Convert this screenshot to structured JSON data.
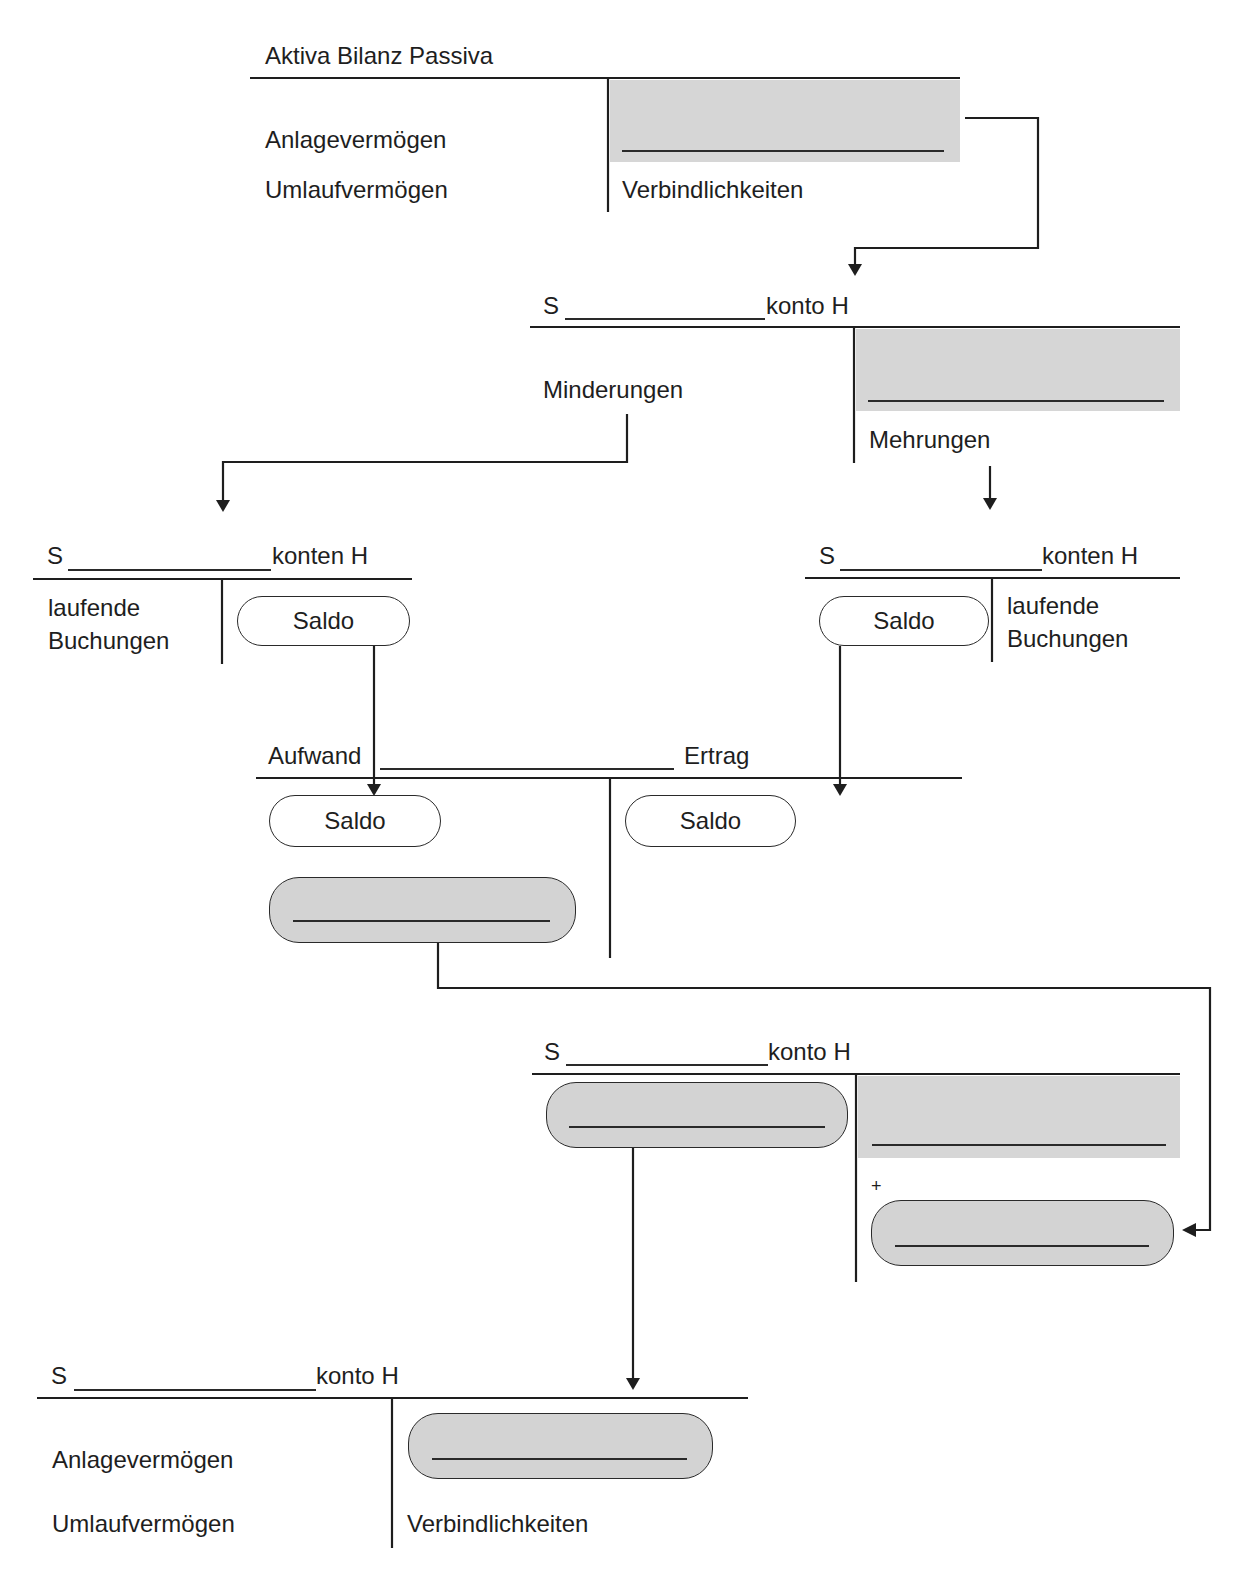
{
  "bilanz_top": {
    "title": "Aktiva Bilanz Passiva",
    "left_items": [
      "Anlagevermögen",
      "Umlaufvermögen"
    ],
    "right_items": [
      "Verbindlichkeiten"
    ],
    "blank_field": ""
  },
  "konto_1": {
    "s_label": "S",
    "suffix": "konto H",
    "blank_field": "",
    "left_label": "Minderungen",
    "right_label": "Mehrungen"
  },
  "konto_left": {
    "s_label": "S",
    "suffix": "konten H",
    "left_label_line1": "laufende",
    "left_label_line2": "Buchungen",
    "saldo": "Saldo"
  },
  "konto_right": {
    "s_label": "S",
    "suffix": "konten H",
    "right_label_line1": "laufende",
    "right_label_line2": "Buchungen",
    "saldo": "Saldo"
  },
  "guv": {
    "left_header": "Aufwand",
    "right_header": "Ertrag",
    "left_saldo": "Saldo",
    "right_saldo": "Saldo",
    "result_blank": ""
  },
  "konto_2": {
    "s_label": "S",
    "suffix": "konto H",
    "plus": "+",
    "left_blank": "",
    "right_blank": "",
    "right_pill_blank": ""
  },
  "bilanz_bottom": {
    "s_label": "S",
    "suffix": "konto H",
    "left_items": [
      "Anlagevermögen",
      "Umlaufvermögen"
    ],
    "right_items": [
      "Verbindlichkeiten"
    ],
    "pill_blank": ""
  },
  "colors": {
    "line": "#1e1e1e",
    "shade": "#d6d6d6"
  }
}
